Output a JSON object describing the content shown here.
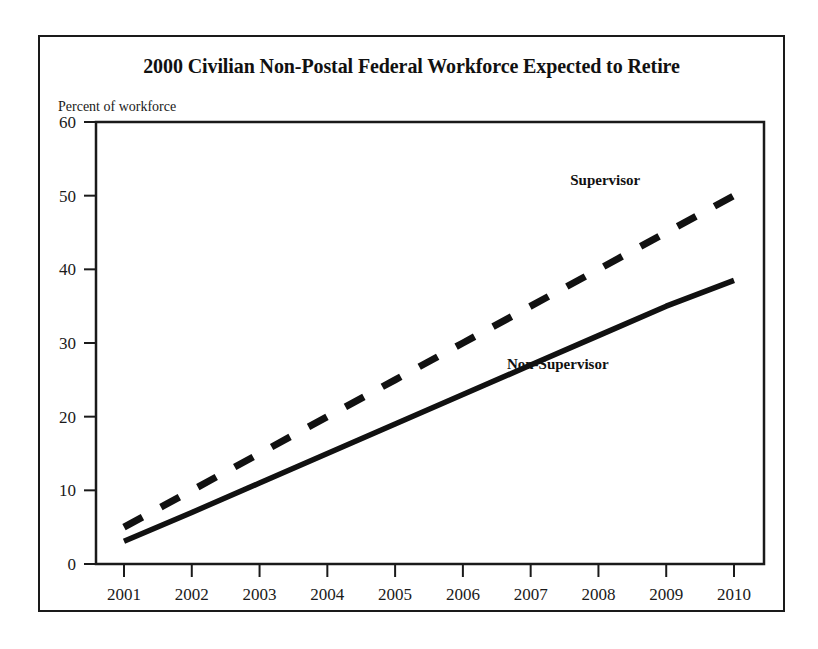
{
  "figure": {
    "title": "2000 Civilian Non-Postal Federal Workforce Expected to Retire",
    "axis_note": "Percent of workforce",
    "frame_color": "#1a1a1a",
    "background_color": "#ffffff"
  },
  "chart_data": {
    "type": "line",
    "title": "2000 Civilian Non-Postal Federal Workforce Expected to Retire",
    "subtitle": "Percent of workforce",
    "xlabel": "",
    "ylabel": "Percent of workforce",
    "x": [
      "2001",
      "2002",
      "2003",
      "2004",
      "2005",
      "2006",
      "2007",
      "2008",
      "2009",
      "2010"
    ],
    "xlim": [
      2001,
      2010
    ],
    "ylim": [
      0,
      60
    ],
    "y_ticks": [
      0,
      10,
      20,
      30,
      40,
      50,
      60
    ],
    "x_ticks": [
      "2001",
      "2002",
      "2003",
      "2004",
      "2005",
      "2006",
      "2007",
      "2008",
      "2009",
      "2010"
    ],
    "grid": false,
    "legend": "inline-annotations",
    "series": [
      {
        "name": "Supervisor",
        "style": "dashed",
        "color": "#111111",
        "label_position": "above-line",
        "values": [
          5.0,
          10.0,
          15.0,
          20.0,
          25.0,
          30.0,
          35.0,
          40.0,
          45.0,
          50.0
        ]
      },
      {
        "name": "Non-Supervisor",
        "style": "solid",
        "color": "#111111",
        "label_position": "below-line",
        "values": [
          3.1,
          7.0,
          11.0,
          15.0,
          19.0,
          23.0,
          27.0,
          31.0,
          35.0,
          38.5
        ]
      }
    ],
    "annotations": [
      {
        "text": "Supervisor",
        "x": 2008.1,
        "y": 51.5
      },
      {
        "text": "Non-Supervisor",
        "x": 2007.4,
        "y": 26.5
      }
    ]
  }
}
